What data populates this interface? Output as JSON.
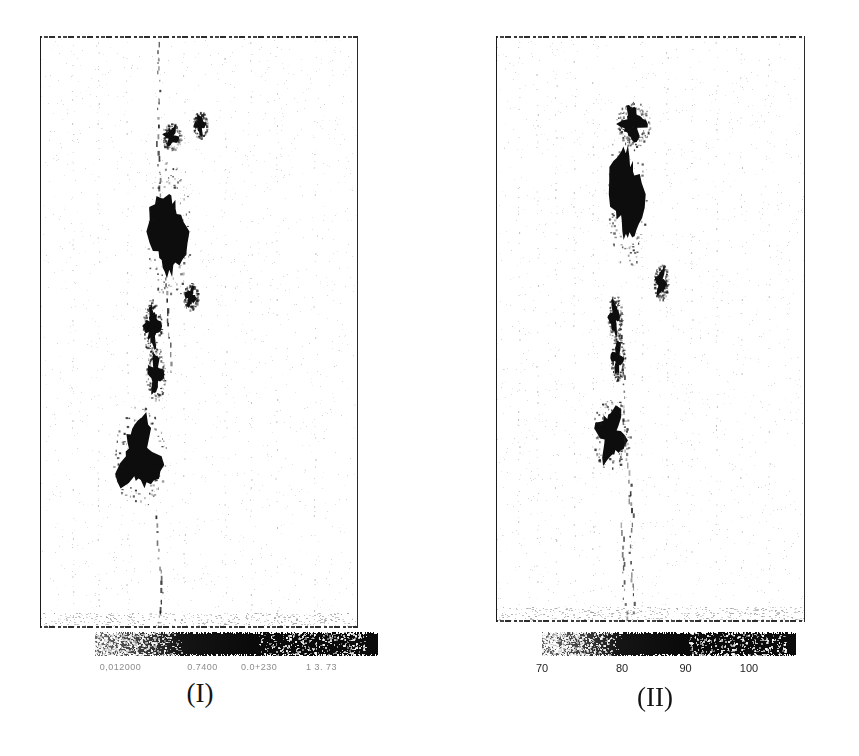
{
  "figure": {
    "kind": "scanned-figure",
    "background_color": "#ffffff",
    "ink_color": "#111111",
    "width": 859,
    "height": 756
  },
  "panels": [
    {
      "id": "panel-1",
      "caption": "(I)",
      "caption_center_x": 200,
      "caption_y": 678,
      "frame": {
        "x": 40,
        "y": 36,
        "width": 318,
        "height": 592
      },
      "colorbar": {
        "x": 95,
        "y": 632,
        "width": 283,
        "height": 24,
        "low_color": "#5f5f5f",
        "high_color": "#070707",
        "orientation": "horizontal",
        "tick_labels": [
          "0,012000",
          "0.7400",
          "0.0+230",
          "1 3. 73"
        ],
        "tick_label_positions": [
          0.09,
          0.38,
          0.58,
          0.8
        ],
        "tick_labels_legible": false,
        "note_on_labels": "tick numerals destroyed by scan noise; rendered as illegible smudges"
      }
    },
    {
      "id": "panel-2",
      "caption": "(II)",
      "caption_center_x": 655,
      "caption_y": 682,
      "frame": {
        "x": 496,
        "y": 36,
        "width": 309,
        "height": 586
      },
      "colorbar": {
        "x": 542,
        "y": 632,
        "width": 254,
        "height": 24,
        "low_color": "#5a5a5a",
        "high_color": "#060606",
        "orientation": "horizontal",
        "tick_labels": [
          "70",
          "80",
          "90",
          "100"
        ],
        "tick_label_positions": [
          0.0,
          0.315,
          0.565,
          0.815
        ],
        "tick_labels_legible": true
      }
    }
  ],
  "chart_data": {
    "type": "heatmap",
    "title": "",
    "subtitle": "",
    "xlabel": "",
    "ylabel": "",
    "grid": false,
    "legend_position": "below-each-panel",
    "panel_count": 2,
    "panels": [
      {
        "label": "(I)",
        "colorbar": {
          "tick_labels": [
            "0,012000",
            "0.7400",
            "0.0+230",
            "1 3. 73"
          ],
          "tick_values": [
            null,
            null,
            null,
            null
          ],
          "legible": false,
          "ramp": "light-grey (low) to black (high), reversed greyscale"
        },
        "features": [
          {
            "name": "thin-dotted-trace-top",
            "shape": "dotted line",
            "cx_frac": 0.37,
            "cy_frac": 0.1,
            "intensity": "low"
          },
          {
            "name": "small-patch-upper",
            "shape": "blob",
            "cx_frac": 0.41,
            "cy_frac": 0.17,
            "w_frac": 0.04,
            "h_frac": 0.03,
            "intensity": "high"
          },
          {
            "name": "tick-patch-upper-right",
            "shape": "sliver",
            "cx_frac": 0.5,
            "cy_frac": 0.15,
            "w_frac": 0.03,
            "h_frac": 0.03,
            "intensity": "high"
          },
          {
            "name": "main-blob-upper",
            "shape": "elongated blob",
            "cx_frac": 0.4,
            "cy_frac": 0.33,
            "w_frac": 0.09,
            "h_frac": 0.16,
            "intensity": "very-high"
          },
          {
            "name": "isolated-patch-mid",
            "shape": "small blob",
            "cx_frac": 0.47,
            "cy_frac": 0.44,
            "w_frac": 0.03,
            "h_frac": 0.03,
            "intensity": "high"
          },
          {
            "name": "patch-mid-left-a",
            "shape": "lens",
            "cx_frac": 0.35,
            "cy_frac": 0.49,
            "w_frac": 0.04,
            "h_frac": 0.06,
            "intensity": "high"
          },
          {
            "name": "patch-mid-left-b",
            "shape": "lens",
            "cx_frac": 0.36,
            "cy_frac": 0.57,
            "w_frac": 0.04,
            "h_frac": 0.06,
            "intensity": "high"
          },
          {
            "name": "main-blob-lower",
            "shape": "wedge blob",
            "cx_frac": 0.31,
            "cy_frac": 0.71,
            "w_frac": 0.11,
            "h_frac": 0.11,
            "intensity": "very-high"
          },
          {
            "name": "dotted-trace-bottom",
            "shape": "dotted line",
            "cx_frac": 0.36,
            "cy_frac": 0.9,
            "intensity": "low"
          }
        ]
      },
      {
        "label": "(II)",
        "colorbar": {
          "tick_labels": [
            "70",
            "80",
            "90",
            "100"
          ],
          "tick_values": [
            70,
            80,
            90,
            100
          ],
          "legible": true,
          "range": [
            66,
            108
          ],
          "ramp": "light-grey (low) to black (high), reversed greyscale"
        },
        "features": [
          {
            "name": "hook-patch-top",
            "shape": "hook",
            "cx_frac": 0.44,
            "cy_frac": 0.15,
            "w_frac": 0.07,
            "h_frac": 0.05,
            "intensity": "high"
          },
          {
            "name": "main-blob-upper",
            "shape": "elongated blob",
            "cx_frac": 0.42,
            "cy_frac": 0.27,
            "w_frac": 0.08,
            "h_frac": 0.17,
            "intensity": "very-high"
          },
          {
            "name": "isolated-patch-mid",
            "shape": "small blob",
            "cx_frac": 0.53,
            "cy_frac": 0.42,
            "w_frac": 0.03,
            "h_frac": 0.04,
            "intensity": "high"
          },
          {
            "name": "patch-mid-left-a",
            "shape": "sliver",
            "cx_frac": 0.38,
            "cy_frac": 0.48,
            "w_frac": 0.03,
            "h_frac": 0.05,
            "intensity": "high"
          },
          {
            "name": "patch-mid-left-b",
            "shape": "sliver",
            "cx_frac": 0.39,
            "cy_frac": 0.55,
            "w_frac": 0.03,
            "h_frac": 0.05,
            "intensity": "high"
          },
          {
            "name": "main-blob-lower",
            "shape": "round blob",
            "cx_frac": 0.37,
            "cy_frac": 0.68,
            "w_frac": 0.08,
            "h_frac": 0.08,
            "intensity": "very-high"
          },
          {
            "name": "dotted-trace-spine",
            "shape": "dotted line",
            "cx_frac": 0.4,
            "cy_frac": 0.6,
            "intensity": "low"
          },
          {
            "name": "dotted-trace-bottom",
            "shape": "dotted line",
            "cx_frac": 0.4,
            "cy_frac": 0.92,
            "intensity": "low"
          }
        ]
      }
    ]
  }
}
